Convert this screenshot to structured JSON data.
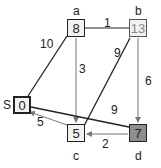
{
  "nodes": {
    "S": {
      "label": "S",
      "value": "0"
    },
    "a": {
      "label": "a",
      "value": "8"
    },
    "b": {
      "label": "b",
      "value": "13"
    },
    "c": {
      "label": "c",
      "value": "5"
    },
    "d": {
      "label": "d",
      "value": "7"
    }
  },
  "edges": [
    {
      "from": "S",
      "to": "a",
      "weight": "10"
    },
    {
      "from": "a",
      "to": "b",
      "weight": "1"
    },
    {
      "from": "a",
      "to": "c",
      "weight": "3"
    },
    {
      "from": "b",
      "to": "c",
      "weight": "9"
    },
    {
      "from": "b",
      "to": "d",
      "weight": "6"
    },
    {
      "from": "S",
      "to": "d",
      "weight": "9"
    },
    {
      "from": "d",
      "to": "c",
      "weight": "2"
    },
    {
      "from": "c",
      "to": "S",
      "weight": "5"
    }
  ],
  "colors": {
    "highlight_node": "#8e8e8e",
    "node_fill": "#f2f2f2",
    "edge_dark": "#222222",
    "edge_gray": "#777777"
  }
}
